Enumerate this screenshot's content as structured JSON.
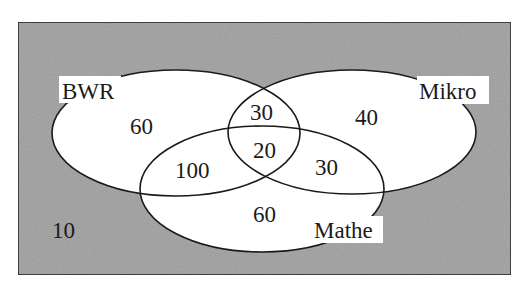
{
  "diagram": {
    "type": "venn",
    "colors": {
      "universe_background": "#a9a9a9",
      "set_fill": "#ffffff",
      "stroke": "#1a1a1a",
      "text": "#1a1a1a"
    },
    "sets": [
      {
        "id": "bwr",
        "label": "BWR"
      },
      {
        "id": "mikro",
        "label": "Mikro"
      },
      {
        "id": "mathe",
        "label": "Mathe"
      }
    ],
    "regions": {
      "bwr_only": "60",
      "mikro_only": "40",
      "mathe_only": "60",
      "bwr_mikro_only": "30",
      "bwr_mathe_only": "100",
      "mikro_mathe_only": "30",
      "all_three": "20",
      "none": "10"
    }
  }
}
